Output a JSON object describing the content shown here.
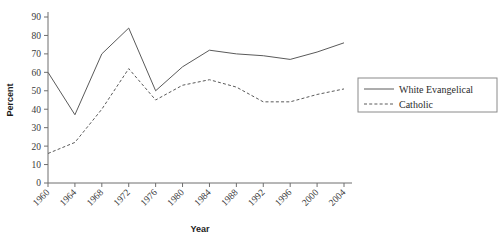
{
  "chart_data": {
    "type": "line",
    "title": "",
    "xlabel": "Year",
    "ylabel": "Percent",
    "xlim": [
      1960,
      2006
    ],
    "ylim": [
      0,
      90
    ],
    "grid": false,
    "legend_position": "right",
    "x": [
      1960,
      1964,
      1968,
      1972,
      1976,
      1980,
      1984,
      1988,
      1992,
      1996,
      2000,
      2004
    ],
    "xtick_labels": [
      "1960",
      "1964",
      "1968",
      "1972",
      "1976",
      "1980",
      "1984",
      "1988",
      "1992",
      "1996",
      "2000",
      "2004"
    ],
    "ytick_labels": [
      "0",
      "10",
      "20",
      "30",
      "40",
      "50",
      "60",
      "70",
      "80",
      "90"
    ],
    "ytick_values": [
      0,
      10,
      20,
      30,
      40,
      50,
      60,
      70,
      80,
      90
    ],
    "series": [
      {
        "name": "White Evangelical",
        "style": "solid",
        "color": "#5a5a5a",
        "values": [
          60,
          37,
          70,
          84,
          50,
          63,
          72,
          70,
          69,
          67,
          71,
          76
        ]
      },
      {
        "name": "Catholic",
        "style": "dashed",
        "color": "#5a5a5a",
        "values": [
          16,
          22,
          40,
          62,
          45,
          53,
          56,
          52,
          44,
          44,
          48,
          51
        ]
      }
    ]
  },
  "legend": {
    "entries": [
      {
        "label": "White Evangelical",
        "style": "solid"
      },
      {
        "label": "Catholic",
        "style": "dashed"
      }
    ]
  },
  "axes": {
    "x_title": "Year",
    "y_title": "Percent"
  }
}
